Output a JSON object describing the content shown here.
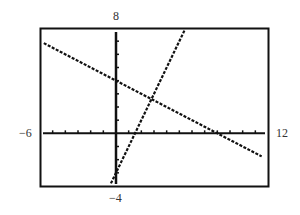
{
  "chart_data": {
    "type": "line",
    "title": "",
    "xlabel": "",
    "ylabel": "",
    "xlim": [
      -6,
      12
    ],
    "ylim": [
      -4,
      8
    ],
    "xscale_ticks": 1,
    "yscale_ticks": 1,
    "grid": false,
    "window_labels": {
      "xmin": "-6",
      "xmax": "12",
      "ymin": "-4",
      "ymax": "8"
    },
    "series": [
      {
        "name": "line-decreasing",
        "equation": "y = -0.5x + 4",
        "x": [
          -5.7,
          11.5
        ],
        "y": [
          6.85,
          -1.75
        ],
        "style": "dotted"
      },
      {
        "name": "line-increasing",
        "equation": "y = 2x - 3",
        "x": [
          -0.4,
          5.4
        ],
        "y": [
          -3.8,
          7.8
        ],
        "style": "dotted"
      }
    ],
    "intersection": {
      "x": 2.8,
      "y": 2.6
    }
  }
}
